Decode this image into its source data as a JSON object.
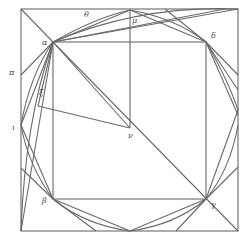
{
  "diagram": {
    "type": "geometric-figure",
    "stroke_color": "#6a6a6a",
    "label_color": "#4a4a4a",
    "labels": {
      "alpha": "α",
      "beta": "β",
      "gamma": "γ",
      "delta": "δ",
      "mu": "μ",
      "nu": "ν",
      "pi": "π",
      "iota": "ι",
      "xi": "ξ",
      "theta": "θ"
    },
    "points": {
      "outer_tl": [
        21,
        9
      ],
      "outer_tr": [
        238,
        9
      ],
      "outer_bl": [
        21,
        231
      ],
      "outer_br": [
        238,
        231
      ],
      "alpha": [
        53,
        42
      ],
      "delta": [
        206,
        42
      ],
      "beta": [
        53,
        199
      ],
      "gamma": [
        206,
        199
      ],
      "mu": [
        130,
        10
      ],
      "nu": [
        130,
        128
      ]
    }
  }
}
